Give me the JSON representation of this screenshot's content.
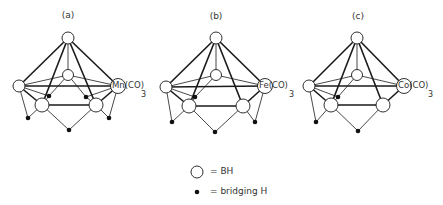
{
  "diagram": {
    "panels": [
      {
        "id": "a",
        "label": "(a)",
        "metal_label": "Mn(CO)",
        "subscript": "3",
        "metal": "Mn"
      },
      {
        "id": "b",
        "label": "(b)",
        "metal_label": "Fe(CO)",
        "subscript": "3",
        "metal": "Fe"
      },
      {
        "id": "c",
        "label": "(c)",
        "metal_label": "Co(CO)",
        "subscript": "3",
        "metal": "Co"
      }
    ],
    "legend": {
      "bh": {
        "symbol": "open-circle",
        "text": "= BH"
      },
      "bridging": {
        "symbol": "filled-dot",
        "text": "= bridging  H"
      }
    },
    "colors": {
      "line": "#1a1a1a",
      "node_fill": "#ffffff",
      "dot": "#111111"
    }
  }
}
